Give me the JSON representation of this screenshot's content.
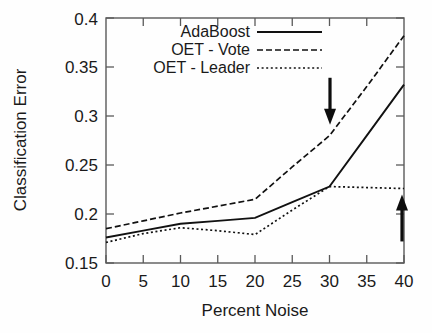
{
  "chart_data": {
    "type": "line",
    "title": "",
    "xlabel": "Percent Noise",
    "ylabel": "Classification Error",
    "xlim": [
      0,
      40
    ],
    "ylim": [
      0.15,
      0.4
    ],
    "grid": false,
    "legend_position": "top-center",
    "x": [
      0,
      5,
      10,
      15,
      20,
      25,
      30,
      35,
      40
    ],
    "xticks": [
      "0",
      "5",
      "10",
      "15",
      "20",
      "25",
      "30",
      "35",
      "40"
    ],
    "yticks": [
      "0.15",
      "0.2",
      "0.25",
      "0.3",
      "0.35",
      "0.4"
    ],
    "series": [
      {
        "name": "AdaBoost",
        "style": "solid",
        "values": [
          0.176,
          0.183,
          0.19,
          0.193,
          0.196,
          0.212,
          0.228,
          0.28,
          0.332
        ]
      },
      {
        "name": "OET - Vote",
        "style": "dashed",
        "values": [
          0.185,
          0.193,
          0.201,
          0.208,
          0.215,
          0.248,
          0.28,
          0.33,
          0.382
        ]
      },
      {
        "name": "OET - Leader",
        "style": "dotted",
        "values": [
          0.171,
          0.18,
          0.186,
          0.183,
          0.179,
          0.204,
          0.228,
          0.227,
          0.226
        ]
      }
    ],
    "annotations": [
      {
        "name": "down-arrow",
        "direction": "down",
        "x": 30,
        "y_from": 0.339,
        "y_to": 0.291
      },
      {
        "name": "up-arrow",
        "direction": "up",
        "x": 40,
        "y_from": 0.172,
        "y_to": 0.22
      }
    ]
  },
  "legend": {
    "entries": [
      {
        "label": "AdaBoost",
        "style": "solid"
      },
      {
        "label": "OET - Vote",
        "style": "dashed"
      },
      {
        "label": "OET - Leader",
        "style": "dotted"
      }
    ]
  },
  "colors": {
    "ink": "#111111",
    "frame": "#5a5a5a",
    "background": "#fefefe"
  }
}
